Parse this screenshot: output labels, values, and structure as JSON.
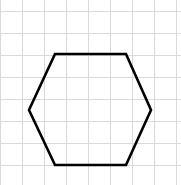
{
  "canvas": {
    "width": 181,
    "height": 185,
    "background_color": "#ffffff"
  },
  "grid": {
    "visible": true,
    "line_color": "#d9d9d9",
    "line_width": 1,
    "cell_size": 22,
    "x_lines": [
      0,
      22,
      44,
      66,
      88,
      110,
      132,
      154,
      176
    ],
    "y_lines": [
      11,
      33,
      55,
      77,
      99,
      121,
      143,
      165
    ]
  },
  "chart_data": {
    "type": "scatter",
    "title": "",
    "subtitle": "",
    "xlabel": "",
    "ylabel": "",
    "xlim": [
      0,
      181
    ],
    "ylim": [
      185,
      0
    ],
    "grid": true,
    "legend": null,
    "annotations": [],
    "shapes": [
      {
        "name": "hexagon",
        "kind": "polygon",
        "sides": 6,
        "orientation": "pointy-left-right",
        "stroke_color": "#000000",
        "stroke_width": 2.6,
        "fill": "none",
        "vertices": [
          [
            55,
            54
          ],
          [
            126,
            54
          ],
          [
            151,
            110
          ],
          [
            126,
            165
          ],
          [
            55,
            165
          ],
          [
            29,
            110
          ]
        ],
        "width_px": 122,
        "height_px": 111,
        "top_edge_length_px": 71,
        "bottom_edge_length_px": 71,
        "center": [
          90,
          109.5
        ]
      }
    ]
  },
  "figure": {
    "shape_name": "hexagon",
    "shape_label": "",
    "caption": ""
  }
}
